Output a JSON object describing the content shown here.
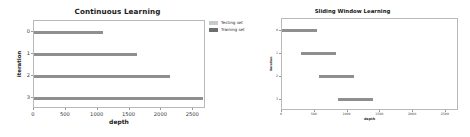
{
  "figure": {
    "background": "#ffffff",
    "bar_color": "#8f8f8f"
  },
  "legend": {
    "position": "center-between-panels",
    "entries": [
      {
        "label": "Testing set",
        "color": "#c9c9c9",
        "swatch_name": "testing-set-swatch"
      },
      {
        "label": "Training set",
        "color": "#6e6e6e",
        "swatch_name": "training-set-swatch"
      }
    ]
  },
  "chart_data": [
    {
      "type": "bar",
      "orientation": "horizontal",
      "title": "Continuous Learning",
      "xlabel": "depth",
      "ylabel": "iteration",
      "categories": [
        "0",
        "1",
        "2",
        "3"
      ],
      "xticks": [
        0,
        500,
        1000,
        1500,
        2000,
        2500
      ],
      "xticklabels": [
        "0",
        "500",
        "1000",
        "1500",
        "2000",
        "2500"
      ],
      "yticklabels": [
        "0",
        "1",
        "2",
        "3"
      ],
      "xlim": [
        0,
        2700
      ],
      "grid": false,
      "series": [
        {
          "name": "Training set",
          "color": "#8f8f8f",
          "starts": [
            0,
            0,
            0,
            0
          ],
          "values": [
            1080,
            1610,
            2130,
            2650
          ]
        }
      ]
    },
    {
      "type": "bar",
      "orientation": "horizontal",
      "title": "Sliding Window Learning",
      "xlabel": "depth",
      "ylabel": "iteration",
      "categories": [
        "0",
        "1",
        "2",
        "3"
      ],
      "xticks": [
        0,
        500,
        1000,
        1500,
        2000,
        2500
      ],
      "xticklabels": [
        "0",
        "500",
        "1000",
        "1500",
        "2000",
        "2500"
      ],
      "yticklabels": [
        "0",
        "1",
        "2",
        "3"
      ],
      "xlim": [
        0,
        2700
      ],
      "grid": false,
      "series": [
        {
          "name": "Training set",
          "color": "#8f8f8f",
          "starts": [
            0,
            290,
            570,
            860
          ],
          "values": [
            530,
            530,
            530,
            530
          ]
        }
      ]
    }
  ]
}
